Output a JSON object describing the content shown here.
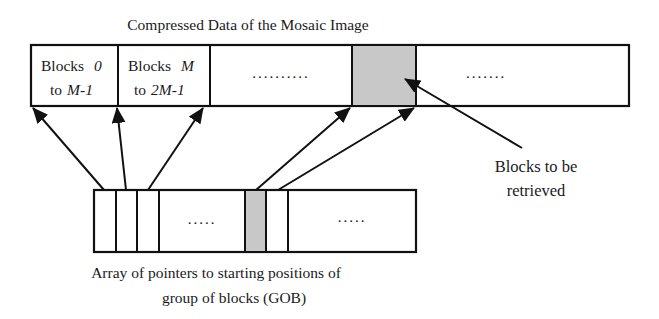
{
  "title": "Compressed Data of the Mosaic Image",
  "top_array": {
    "cells": [
      {
        "line1_plain": "Blocks",
        "line1_italic": "0",
        "line2_plain": "to",
        "line2_italic": "M-1"
      },
      {
        "line1_plain": "Blocks",
        "line1_italic": "M",
        "line2_plain": "to",
        "line2_italic": "2M-1"
      }
    ],
    "ellipsis_1": "..........",
    "ellipsis_2": ".......",
    "highlight_color": "#c8c8c8"
  },
  "bottom_array": {
    "ellipsis_1": ".....",
    "ellipsis_2": ".....",
    "highlight_color": "#c8c8c8"
  },
  "annotation": {
    "line1": "Blocks to be",
    "line2": "retrieved"
  },
  "caption": {
    "line1": "Array of pointers to starting positions of",
    "line2": "group of blocks (GOB)"
  }
}
